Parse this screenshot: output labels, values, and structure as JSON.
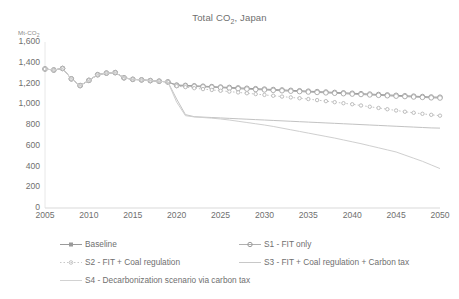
{
  "chart_data": {
    "type": "line",
    "title": "Total CO2, Japan",
    "title_main": "Total CO",
    "title_sub": "2",
    "title_tail": ", Japan",
    "ylabel": "Mt-CO2",
    "ylabel_main": "Mt-CO",
    "ylabel_sub": "2",
    "xlabel": "",
    "ylim": [
      0,
      1600
    ],
    "xlim": [
      2005,
      2050
    ],
    "yticks": [
      "0",
      "200",
      "400",
      "600",
      "800",
      "1,000",
      "1,200",
      "1,400",
      "1,600"
    ],
    "ytick_values": [
      0,
      200,
      400,
      600,
      800,
      1000,
      1200,
      1400,
      1600
    ],
    "xticks": [
      "2005",
      "2010",
      "2015",
      "2020",
      "2025",
      "2030",
      "2035",
      "2040",
      "2045",
      "2050"
    ],
    "xtick_values": [
      2005,
      2010,
      2015,
      2020,
      2025,
      2030,
      2035,
      2040,
      2045,
      2050
    ],
    "grid": false,
    "legend_position": "bottom",
    "x": [
      2005,
      2006,
      2007,
      2008,
      2009,
      2010,
      2011,
      2012,
      2013,
      2014,
      2015,
      2016,
      2017,
      2018,
      2019,
      2020,
      2021,
      2022,
      2023,
      2024,
      2025,
      2026,
      2027,
      2028,
      2029,
      2030,
      2031,
      2032,
      2033,
      2034,
      2035,
      2036,
      2037,
      2038,
      2039,
      2040,
      2041,
      2042,
      2043,
      2044,
      2045,
      2046,
      2047,
      2048,
      2049,
      2050
    ],
    "series": [
      {
        "name": "Baseline",
        "color": "#9a9a9a",
        "style": "line-marker",
        "values": [
          1340,
          1330,
          1345,
          1245,
          1180,
          1230,
          1285,
          1300,
          1305,
          1255,
          1240,
          1235,
          1228,
          1222,
          1215,
          1185,
          1182,
          1178,
          1174,
          1170,
          1166,
          1162,
          1158,
          1154,
          1150,
          1146,
          1142,
          1138,
          1134,
          1130,
          1126,
          1122,
          1118,
          1114,
          1110,
          1106,
          1102,
          1098,
          1094,
          1090,
          1086,
          1082,
          1078,
          1074,
          1070,
          1068
        ]
      },
      {
        "name": "S1 - FIT only",
        "color": "#a8a8a8",
        "style": "line-marker",
        "values": [
          1340,
          1330,
          1345,
          1245,
          1180,
          1230,
          1285,
          1300,
          1305,
          1255,
          1240,
          1235,
          1228,
          1222,
          1215,
          1180,
          1176,
          1172,
          1168,
          1164,
          1160,
          1155,
          1150,
          1146,
          1142,
          1138,
          1134,
          1130,
          1126,
          1122,
          1118,
          1114,
          1110,
          1106,
          1102,
          1098,
          1094,
          1090,
          1086,
          1082,
          1078,
          1074,
          1070,
          1066,
          1062,
          1060
        ]
      },
      {
        "name": "S2 - FIT + Coal regulation",
        "color": "#b5b5b5",
        "style": "dotted-marker",
        "values": [
          1340,
          1330,
          1345,
          1245,
          1180,
          1230,
          1285,
          1300,
          1305,
          1255,
          1240,
          1235,
          1228,
          1222,
          1215,
          1175,
          1165,
          1155,
          1146,
          1138,
          1130,
          1122,
          1114,
          1106,
          1098,
          1090,
          1082,
          1074,
          1066,
          1058,
          1050,
          1040,
          1030,
          1020,
          1010,
          1000,
          988,
          976,
          964,
          952,
          940,
          928,
          918,
          908,
          898,
          890
        ]
      },
      {
        "name": "S3 - FIT + Coal regulation + Carbon tax",
        "color": "#c2c2c2",
        "style": "line",
        "values": [
          1340,
          1330,
          1345,
          1245,
          1180,
          1230,
          1285,
          1300,
          1305,
          1255,
          1240,
          1235,
          1228,
          1222,
          1215,
          1050,
          900,
          880,
          876,
          872,
          868,
          864,
          860,
          856,
          852,
          848,
          844,
          840,
          836,
          832,
          828,
          824,
          820,
          816,
          812,
          808,
          804,
          800,
          796,
          792,
          788,
          784,
          780,
          776,
          772,
          770
        ]
      },
      {
        "name": "S4 - Decarbonization scenario via carbon tax",
        "color": "#cfcfcf",
        "style": "line",
        "values": [
          1340,
          1330,
          1345,
          1245,
          1180,
          1230,
          1285,
          1300,
          1305,
          1255,
          1240,
          1235,
          1228,
          1222,
          1215,
          1020,
          890,
          878,
          872,
          866,
          858,
          848,
          836,
          824,
          812,
          800,
          786,
          770,
          754,
          738,
          722,
          706,
          690,
          674,
          656,
          638,
          620,
          600,
          580,
          560,
          540,
          510,
          480,
          450,
          415,
          380
        ]
      }
    ]
  },
  "legend": {
    "items": [
      {
        "label": "Baseline",
        "key": "line-marker"
      },
      {
        "label": "S1 - FIT only",
        "key": "line-marker"
      },
      {
        "label": "S2 - FIT + Coal regulation",
        "key": "dotted-marker"
      },
      {
        "label": "S3 - FIT + Coal regulation + Carbon tax",
        "key": "line"
      },
      {
        "label": "S4 - Decarbonization scenario via carbon tax",
        "key": "line"
      }
    ]
  }
}
